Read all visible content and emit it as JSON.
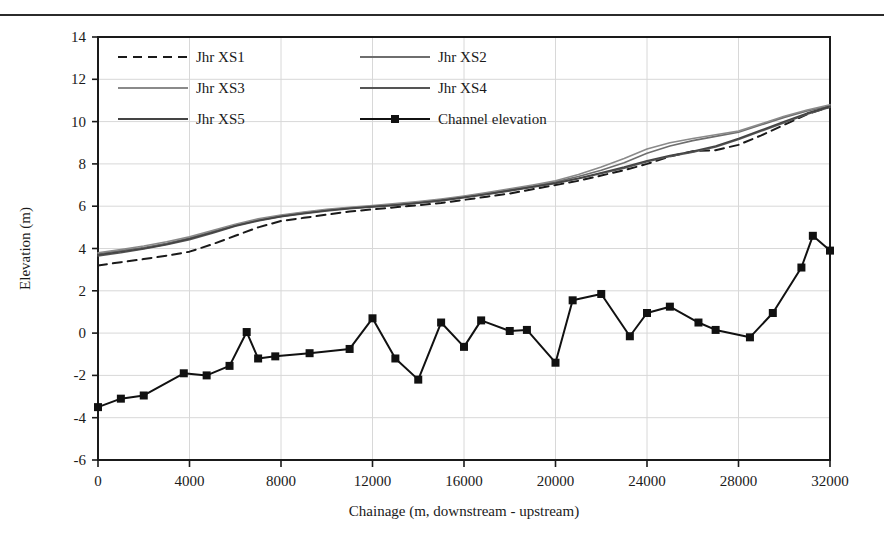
{
  "figure": {
    "has_top_rule": true,
    "background": "#ffffff"
  },
  "chart_data": {
    "type": "line",
    "title": "",
    "xlabel": "Chainage (m, downstream - upstream)",
    "ylabel": "Elevation (m)",
    "xlim": [
      0,
      32000
    ],
    "ylim": [
      -6,
      14
    ],
    "xticks": [
      0,
      4000,
      8000,
      12000,
      16000,
      20000,
      24000,
      28000,
      32000
    ],
    "yticks": [
      -6,
      -4,
      -2,
      0,
      2,
      4,
      6,
      8,
      10,
      12,
      14
    ],
    "xtick_labels": [
      "0",
      "4000",
      "8000",
      "12000",
      "16000",
      "20000",
      "24000",
      "28000",
      "32000"
    ],
    "ytick_labels": [
      "-6",
      "-4",
      "-2",
      "0",
      "2",
      "4",
      "6",
      "8",
      "10",
      "12",
      "14"
    ],
    "grid": true,
    "grid_color": "#d8d8d8",
    "legend_position": "top-left-inside",
    "series": [
      {
        "name": "Jhr XS1",
        "style": "dashed",
        "color": "#1a1a1a",
        "width": 2.0,
        "marker": "none",
        "x": [
          0,
          1000,
          2000,
          3000,
          4000,
          5000,
          6000,
          7000,
          8000,
          9000,
          10000,
          11000,
          12000,
          13000,
          14000,
          15000,
          16000,
          17000,
          18000,
          19000,
          20000,
          21000,
          22000,
          23000,
          24000,
          25000,
          26000,
          27000,
          28000,
          29000,
          30000,
          31000,
          32000
        ],
        "y": [
          3.2,
          3.35,
          3.5,
          3.66,
          3.85,
          4.2,
          4.6,
          5.0,
          5.3,
          5.45,
          5.6,
          5.75,
          5.85,
          5.95,
          6.05,
          6.15,
          6.3,
          6.45,
          6.6,
          6.8,
          7.0,
          7.2,
          7.45,
          7.7,
          8.0,
          8.35,
          8.6,
          8.65,
          8.9,
          9.35,
          9.85,
          10.35,
          10.7
        ]
      },
      {
        "name": "Jhr XS2",
        "style": "solid",
        "color": "#6e6e6e",
        "width": 1.6,
        "marker": "none",
        "x": [
          0,
          1000,
          2000,
          3000,
          4000,
          5000,
          6000,
          7000,
          8000,
          9000,
          10000,
          11000,
          12000,
          13000,
          14000,
          15000,
          16000,
          17000,
          18000,
          19000,
          20000,
          21000,
          22000,
          23000,
          24000,
          25000,
          26000,
          27000,
          28000,
          29000,
          30000,
          31000,
          32000
        ],
        "y": [
          3.75,
          3.9,
          4.05,
          4.25,
          4.5,
          4.8,
          5.1,
          5.35,
          5.55,
          5.7,
          5.82,
          5.92,
          6.0,
          6.08,
          6.18,
          6.3,
          6.45,
          6.6,
          6.78,
          6.95,
          7.15,
          7.4,
          7.7,
          8.05,
          8.5,
          8.85,
          9.1,
          9.3,
          9.5,
          9.85,
          10.2,
          10.5,
          10.75
        ]
      },
      {
        "name": "Jhr XS3",
        "style": "solid",
        "color": "#8a8a8a",
        "width": 1.6,
        "marker": "none",
        "x": [
          0,
          1000,
          2000,
          3000,
          4000,
          5000,
          6000,
          7000,
          8000,
          9000,
          10000,
          11000,
          12000,
          13000,
          14000,
          15000,
          16000,
          17000,
          18000,
          19000,
          20000,
          21000,
          22000,
          23000,
          24000,
          25000,
          26000,
          27000,
          28000,
          29000,
          30000,
          31000,
          32000
        ],
        "y": [
          3.8,
          3.95,
          4.12,
          4.32,
          4.55,
          4.85,
          5.15,
          5.4,
          5.58,
          5.72,
          5.85,
          5.95,
          6.03,
          6.12,
          6.22,
          6.34,
          6.48,
          6.64,
          6.82,
          7.0,
          7.2,
          7.5,
          7.85,
          8.25,
          8.7,
          9.0,
          9.2,
          9.38,
          9.55,
          9.9,
          10.25,
          10.55,
          10.8
        ]
      },
      {
        "name": "Jhr XS4",
        "style": "solid",
        "color": "#555555",
        "width": 1.6,
        "marker": "none",
        "x": [
          0,
          1000,
          2000,
          3000,
          4000,
          5000,
          6000,
          7000,
          8000,
          9000,
          10000,
          11000,
          12000,
          13000,
          14000,
          15000,
          16000,
          17000,
          18000,
          19000,
          20000,
          21000,
          22000,
          23000,
          24000,
          25000,
          26000,
          27000,
          28000,
          29000,
          30000,
          31000,
          32000
        ],
        "y": [
          3.65,
          3.8,
          3.98,
          4.18,
          4.42,
          4.72,
          5.05,
          5.3,
          5.5,
          5.65,
          5.78,
          5.88,
          5.96,
          6.04,
          6.14,
          6.25,
          6.4,
          6.55,
          6.72,
          6.9,
          7.08,
          7.3,
          7.55,
          7.8,
          8.1,
          8.35,
          8.55,
          8.8,
          9.15,
          9.55,
          9.95,
          10.35,
          10.68
        ]
      },
      {
        "name": "Jhr XS5",
        "style": "solid",
        "color": "#444444",
        "width": 1.6,
        "marker": "none",
        "x": [
          0,
          1000,
          2000,
          3000,
          4000,
          5000,
          6000,
          7000,
          8000,
          9000,
          10000,
          11000,
          12000,
          13000,
          14000,
          15000,
          16000,
          17000,
          18000,
          19000,
          20000,
          21000,
          22000,
          23000,
          24000,
          25000,
          26000,
          27000,
          28000,
          29000,
          30000,
          31000,
          32000
        ],
        "y": [
          3.7,
          3.85,
          4.0,
          4.2,
          4.46,
          4.76,
          5.08,
          5.32,
          5.52,
          5.67,
          5.8,
          5.9,
          5.98,
          6.06,
          6.16,
          6.28,
          6.42,
          6.58,
          6.75,
          6.92,
          7.1,
          7.32,
          7.58,
          7.85,
          8.15,
          8.4,
          8.6,
          8.85,
          9.2,
          9.6,
          10.0,
          10.4,
          10.72
        ]
      },
      {
        "name": "Channel elevation",
        "style": "solid",
        "color": "#111111",
        "width": 2.0,
        "marker": "square",
        "x": [
          0,
          1000,
          2000,
          3750,
          4750,
          5750,
          6500,
          7000,
          7750,
          9250,
          11000,
          12000,
          13000,
          14000,
          15000,
          16000,
          16750,
          18000,
          18750,
          20000,
          20750,
          22000,
          23250,
          24000,
          25000,
          26250,
          27000,
          28500,
          29500,
          30750,
          31250,
          32000
        ],
        "y": [
          -3.5,
          -3.1,
          -2.95,
          -1.9,
          -2.0,
          -1.55,
          0.05,
          -1.2,
          -1.1,
          -0.95,
          -0.75,
          0.7,
          -1.2,
          -2.2,
          0.5,
          -0.65,
          0.6,
          0.1,
          0.15,
          -1.4,
          1.55,
          1.85,
          -0.15,
          0.95,
          1.25,
          0.5,
          0.15,
          -0.2,
          0.95,
          3.1,
          4.6,
          3.9
        ]
      }
    ],
    "legend": [
      {
        "name": "Jhr XS1",
        "style": "dashed",
        "color": "#1a1a1a",
        "marker": "none"
      },
      {
        "name": "Jhr XS2",
        "style": "solid",
        "color": "#6e6e6e",
        "marker": "none"
      },
      {
        "name": "Jhr XS3",
        "style": "solid",
        "color": "#8a8a8a",
        "marker": "none"
      },
      {
        "name": "Jhr XS4",
        "style": "solid",
        "color": "#555555",
        "marker": "none"
      },
      {
        "name": "Jhr XS5",
        "style": "solid",
        "color": "#444444",
        "marker": "none"
      },
      {
        "name": "Channel elevation",
        "style": "solid",
        "color": "#111111",
        "marker": "square"
      }
    ]
  }
}
